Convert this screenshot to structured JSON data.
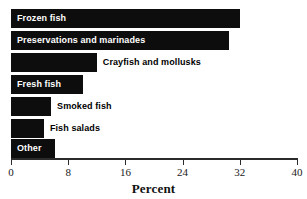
{
  "chart_data": {
    "type": "bar",
    "orientation": "horizontal",
    "title": "",
    "xlabel": "Percent",
    "ylabel": "",
    "xlim": [
      0,
      40
    ],
    "xticks": [
      "0",
      "8",
      "16",
      "24",
      "32",
      "40"
    ],
    "grid": false,
    "legend": false,
    "bar_color": "#0d0d0d",
    "categories": [
      "Frozen fish",
      "Preservations and marinades",
      "Crayfish and mollusks",
      "Fresh fish",
      "Smoked fish",
      "Fish salads",
      "Other"
    ],
    "values": [
      32,
      30.5,
      12,
      10,
      5.6,
      4.6,
      6.2
    ],
    "bars": [
      {
        "label": "Frozen fish",
        "value": 32,
        "label_position": "inside"
      },
      {
        "label": "Preservations and marinades",
        "value": 30.5,
        "label_position": "inside"
      },
      {
        "label": "Crayfish and mollusks",
        "value": 12,
        "label_position": "outside"
      },
      {
        "label": "Fresh fish",
        "value": 10,
        "label_position": "inside"
      },
      {
        "label": "Smoked fish",
        "value": 5.6,
        "label_position": "outside"
      },
      {
        "label": "Fish salads",
        "value": 4.6,
        "label_position": "outside"
      },
      {
        "label": "Other",
        "value": 6.2,
        "label_position": "inside"
      }
    ]
  }
}
